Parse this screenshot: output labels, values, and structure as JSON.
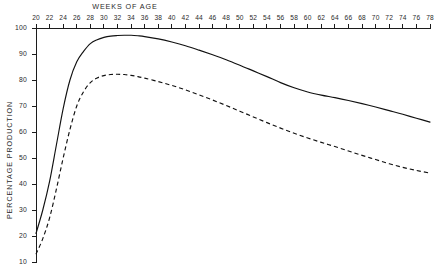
{
  "chart_data": {
    "type": "line",
    "title": "",
    "xlabel": "WEEKS OF AGE",
    "ylabel": "PERCENTAGE PRODUCTION",
    "xlabel_position": "top",
    "ylabel_position": "left",
    "grid": false,
    "legend": "none",
    "xlim": [
      20,
      78
    ],
    "ylim": [
      10,
      100
    ],
    "x_tick_step": 2,
    "y_tick_step": 10,
    "x_ticks": [
      20,
      22,
      24,
      26,
      28,
      30,
      32,
      34,
      36,
      38,
      40,
      42,
      44,
      46,
      48,
      50,
      52,
      54,
      56,
      58,
      60,
      62,
      64,
      66,
      68,
      70,
      72,
      74,
      76,
      78
    ],
    "y_ticks": [
      10,
      20,
      30,
      40,
      50,
      60,
      70,
      80,
      90,
      100
    ],
    "x_tick_labels": [
      "20",
      "22",
      "24",
      "26",
      "28",
      "30",
      "32",
      "34",
      "36",
      "38",
      "40",
      "42",
      "44",
      "46",
      "48",
      "50",
      "52",
      "54",
      "56",
      "58",
      "60",
      "62",
      "64",
      "66",
      "68",
      "70",
      "72",
      "74",
      "76",
      "78"
    ],
    "y_tick_labels": [
      "10",
      "20",
      "30",
      "40",
      "50",
      "60",
      "70",
      "80",
      "90",
      "100"
    ],
    "x": [
      20,
      21,
      22,
      23,
      24,
      25,
      26,
      27,
      28,
      29,
      30,
      31,
      32,
      33,
      34,
      35,
      36,
      38,
      40,
      42,
      44,
      46,
      48,
      50,
      52,
      54,
      56,
      58,
      60,
      62,
      64,
      66,
      68,
      70,
      72,
      74,
      76,
      78
    ],
    "series": [
      {
        "name": "upper-curve",
        "style": "solid",
        "color": "#111111",
        "values": [
          21,
          30,
          41,
          55,
          69,
          80,
          87,
          91,
          94,
          95.5,
          96.4,
          96.9,
          97.1,
          97.2,
          97.2,
          97.0,
          96.7,
          95.8,
          94.6,
          93.2,
          91.5,
          89.7,
          87.8,
          85.7,
          83.5,
          81.3,
          79.0,
          77.0,
          75.4,
          74.2,
          73.2,
          72.1,
          70.9,
          69.6,
          68.2,
          66.8,
          65.3,
          63.8
        ]
      },
      {
        "name": "lower-curve",
        "style": "dashed",
        "color": "#111111",
        "values": [
          13,
          19,
          27,
          38,
          50,
          61,
          70,
          75.5,
          79,
          80.8,
          81.7,
          82.1,
          82.2,
          82.1,
          81.8,
          81.3,
          80.7,
          79.4,
          77.9,
          76.2,
          74.3,
          72.3,
          70.2,
          68.0,
          65.8,
          63.6,
          61.5,
          59.5,
          57.7,
          56.0,
          54.4,
          52.7,
          51.0,
          49.4,
          47.8,
          46.4,
          45.2,
          44.2
        ]
      }
    ],
    "annotations": []
  },
  "axis_titles": {
    "x": "WEEKS OF AGE",
    "y": "PERCENTAGE PRODUCTION"
  }
}
